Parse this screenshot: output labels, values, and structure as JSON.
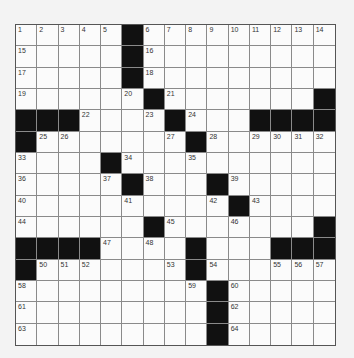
{
  "puzzle": {
    "rows": 15,
    "cols": 15,
    "colors": {
      "black": "#111111",
      "white": "#fbfbfb",
      "line": "#8a8a8a"
    },
    "grid": [
      "#....##........",
      "",
      "",
      "",
      "",
      "",
      "",
      "",
      "",
      "",
      "",
      "",
      "",
      "",
      ""
    ],
    "layout": [
      ".....#.........",
      ".....#.........",
      ".....#.........",
      "......#.......#",
      "###....#...####",
      "#.......#......",
      "....#..........",
      ".....#...#.....",
      "..........#....",
      "......#.......#",
      "####....#...###",
      "#.......#......",
      ".........#.....",
      ".........#.....",
      ".........#....."
    ],
    "numbers": [
      {
        "r": 0,
        "c": 0,
        "n": "1"
      },
      {
        "r": 0,
        "c": 1,
        "n": "2"
      },
      {
        "r": 0,
        "c": 2,
        "n": "3"
      },
      {
        "r": 0,
        "c": 3,
        "n": "4"
      },
      {
        "r": 0,
        "c": 4,
        "n": "5"
      },
      {
        "r": 0,
        "c": 6,
        "n": "6"
      },
      {
        "r": 0,
        "c": 7,
        "n": "7"
      },
      {
        "r": 0,
        "c": 8,
        "n": "8"
      },
      {
        "r": 0,
        "c": 9,
        "n": "9"
      },
      {
        "r": 0,
        "c": 10,
        "n": "10"
      },
      {
        "r": 0,
        "c": 11,
        "n": "11"
      },
      {
        "r": 0,
        "c": 12,
        "n": "12"
      },
      {
        "r": 0,
        "c": 13,
        "n": "13"
      },
      {
        "r": 0,
        "c": 14,
        "n": "14"
      },
      {
        "r": 1,
        "c": 0,
        "n": "15"
      },
      {
        "r": 1,
        "c": 6,
        "n": "16"
      },
      {
        "r": 2,
        "c": 0,
        "n": "17"
      },
      {
        "r": 2,
        "c": 6,
        "n": "18"
      },
      {
        "r": 3,
        "c": 0,
        "n": "19"
      },
      {
        "r": 3,
        "c": 5,
        "n": "20"
      },
      {
        "r": 3,
        "c": 7,
        "n": "21"
      },
      {
        "r": 4,
        "c": 3,
        "n": "22"
      },
      {
        "r": 4,
        "c": 6,
        "n": "23"
      },
      {
        "r": 4,
        "c": 8,
        "n": "24"
      },
      {
        "r": 5,
        "c": 1,
        "n": "25"
      },
      {
        "r": 5,
        "c": 2,
        "n": "26"
      },
      {
        "r": 5,
        "c": 7,
        "n": "27"
      },
      {
        "r": 5,
        "c": 9,
        "n": "28"
      },
      {
        "r": 5,
        "c": 11,
        "n": "29"
      },
      {
        "r": 5,
        "c": 12,
        "n": "30"
      },
      {
        "r": 5,
        "c": 13,
        "n": "31"
      },
      {
        "r": 5,
        "c": 14,
        "n": "32"
      },
      {
        "r": 6,
        "c": 0,
        "n": "33"
      },
      {
        "r": 6,
        "c": 5,
        "n": "34"
      },
      {
        "r": 6,
        "c": 8,
        "n": "35"
      },
      {
        "r": 7,
        "c": 0,
        "n": "36"
      },
      {
        "r": 7,
        "c": 4,
        "n": "37"
      },
      {
        "r": 7,
        "c": 6,
        "n": "38"
      },
      {
        "r": 7,
        "c": 10,
        "n": "39"
      },
      {
        "r": 8,
        "c": 0,
        "n": "40"
      },
      {
        "r": 8,
        "c": 5,
        "n": "41"
      },
      {
        "r": 8,
        "c": 9,
        "n": "42"
      },
      {
        "r": 8,
        "c": 11,
        "n": "43"
      },
      {
        "r": 9,
        "c": 0,
        "n": "44"
      },
      {
        "r": 9,
        "c": 7,
        "n": "45"
      },
      {
        "r": 9,
        "c": 10,
        "n": "46"
      },
      {
        "r": 10,
        "c": 4,
        "n": "47"
      },
      {
        "r": 10,
        "c": 6,
        "n": "48"
      },
      {
        "r": 10,
        "c": 8,
        "n": "49"
      },
      {
        "r": 11,
        "c": 1,
        "n": "50"
      },
      {
        "r": 11,
        "c": 2,
        "n": "51"
      },
      {
        "r": 11,
        "c": 3,
        "n": "52"
      },
      {
        "r": 11,
        "c": 7,
        "n": "53"
      },
      {
        "r": 11,
        "c": 9,
        "n": "54"
      },
      {
        "r": 11,
        "c": 12,
        "n": "55"
      },
      {
        "r": 11,
        "c": 13,
        "n": "56"
      },
      {
        "r": 11,
        "c": 14,
        "n": "57"
      },
      {
        "r": 12,
        "c": 0,
        "n": "58"
      },
      {
        "r": 12,
        "c": 8,
        "n": "59"
      },
      {
        "r": 12,
        "c": 10,
        "n": "60"
      },
      {
        "r": 13,
        "c": 0,
        "n": "61"
      },
      {
        "r": 13,
        "c": 10,
        "n": "62"
      },
      {
        "r": 14,
        "c": 0,
        "n": "63"
      },
      {
        "r": 14,
        "c": 10,
        "n": "64"
      }
    ]
  }
}
